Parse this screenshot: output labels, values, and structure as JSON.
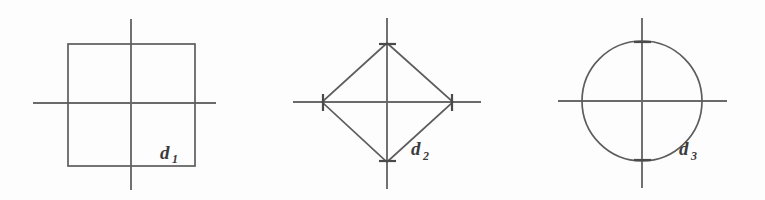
{
  "figure": {
    "background_color": "#fdfdfd",
    "line_color": "#5d5d5d",
    "axis_color": "#6a6a6a",
    "label_color": "#3b3b3b",
    "panels": [
      {
        "id": "panel-square",
        "shape": "square",
        "label_base": "d",
        "label_sub": "1",
        "label_full": "d1",
        "center": {
          "x": 131,
          "y": 103
        },
        "square": {
          "left": 68,
          "top": 44,
          "right": 195,
          "bottom": 166
        },
        "x_axis": {
          "x1": 33,
          "x2": 216,
          "y": 103
        },
        "y_axis": {
          "x": 131,
          "y1": 19,
          "y2": 190
        },
        "label_pos": {
          "x": 160,
          "y": 159
        }
      },
      {
        "id": "panel-diamond",
        "shape": "diamond",
        "label_base": "d",
        "label_sub": "2",
        "label_full": "d2",
        "center": {
          "x": 387,
          "y": 102
        },
        "vertices": [
          {
            "x": 387,
            "y": 43
          },
          {
            "x": 453,
            "y": 102
          },
          {
            "x": 387,
            "y": 162
          },
          {
            "x": 322,
            "y": 102
          }
        ],
        "x_axis": {
          "x1": 293,
          "x2": 481,
          "y": 102
        },
        "y_axis": {
          "x": 387,
          "y1": 18,
          "y2": 189
        },
        "label_pos": {
          "x": 411,
          "y": 155
        }
      },
      {
        "id": "panel-circle",
        "shape": "circle",
        "label_base": "d",
        "label_sub": "3",
        "label_full": "d3",
        "center": {
          "x": 642,
          "y": 101
        },
        "radius": 60,
        "x_axis": {
          "x1": 558,
          "x2": 727,
          "y": 101
        },
        "y_axis": {
          "x": 642,
          "y1": 18,
          "y2": 188
        },
        "label_pos": {
          "x": 679,
          "y": 155
        }
      }
    ]
  }
}
